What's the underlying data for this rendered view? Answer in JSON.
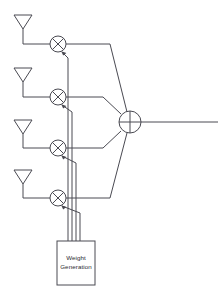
{
  "diagram": {
    "background_color": "#ffffff",
    "line_color": "#4a4a52",
    "text_color": "#2b2b30",
    "canvas": {
      "width": 224,
      "height": 299
    },
    "antennas": [
      {
        "name": "antenna-1",
        "label": "",
        "x": 23,
        "y": 15
      },
      {
        "name": "antenna-2",
        "label": "",
        "x": 23,
        "y": 68
      },
      {
        "name": "antenna-3",
        "label": "",
        "x": 23,
        "y": 120
      },
      {
        "name": "antenna-4",
        "label": "",
        "x": 23,
        "y": 170
      }
    ],
    "mixers": [
      {
        "name": "mixer-1",
        "glyph": "x-multiply",
        "cx": 58,
        "cy": 44,
        "r": 8
      },
      {
        "name": "mixer-2",
        "glyph": "x-multiply",
        "cx": 58,
        "cy": 97,
        "r": 8
      },
      {
        "name": "mixer-3",
        "glyph": "x-multiply",
        "cx": 58,
        "cy": 148,
        "r": 8
      },
      {
        "name": "mixer-4",
        "glyph": "x-multiply",
        "cx": 58,
        "cy": 198,
        "r": 8
      }
    ],
    "summer": {
      "name": "summing-junction",
      "glyph": "plus-add",
      "cx": 130,
      "cy": 122,
      "r": 11
    },
    "weight_block": {
      "name": "weight-generation-block",
      "line1": "Weight",
      "line2": "Generation",
      "x": 57,
      "y": 241,
      "width": 38,
      "height": 44
    },
    "bus_lines": [
      {
        "name": "weight-bus-1",
        "x": 83
      },
      {
        "name": "weight-bus-2",
        "x": 79
      },
      {
        "name": "weight-bus-3",
        "x": 75
      },
      {
        "name": "weight-bus-4",
        "x": 71
      }
    ],
    "output": {
      "name": "array-output-line",
      "label": "",
      "x_start": 141,
      "x_end": 218,
      "y": 122
    }
  }
}
